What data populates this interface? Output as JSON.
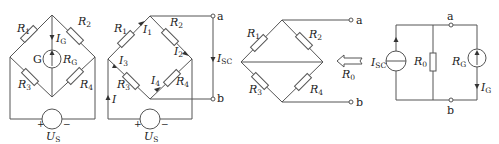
{
  "figure": {
    "panels": [
      {
        "id": "bridge-with-galvanometer",
        "labels": {
          "r1": "R",
          "r1_sub": "1",
          "r2": "R",
          "r2_sub": "2",
          "r3": "R",
          "r3_sub": "3",
          "r4": "R",
          "r4_sub": "4",
          "ig": "I",
          "ig_sub": "G",
          "g": "G",
          "rg": "R",
          "rg_sub": "G",
          "us": "U",
          "us_sub": "S",
          "plus": "+",
          "minus": "−"
        }
      },
      {
        "id": "bridge-short-circuit",
        "labels": {
          "r1": "R",
          "r1_sub": "1",
          "r2": "R",
          "r2_sub": "2",
          "r3": "R",
          "r3_sub": "3",
          "r4": "R",
          "r4_sub": "4",
          "i1": "I",
          "i1_sub": "1",
          "i2": "I",
          "i2_sub": "2",
          "i3": "I",
          "i3_sub": "3",
          "i4": "I",
          "i4_sub": "4",
          "i": "I",
          "isc": "I",
          "isc_sub": "SC",
          "a": "a",
          "b": "b",
          "us": "U",
          "us_sub": "S",
          "plus": "+",
          "minus": "−"
        }
      },
      {
        "id": "bridge-equivalent-resistance",
        "labels": {
          "r1": "R",
          "r1_sub": "1",
          "r2": "R",
          "r2_sub": "2",
          "r3": "R",
          "r3_sub": "3",
          "r4": "R",
          "r4_sub": "4",
          "a": "a",
          "b": "b",
          "r0": "R",
          "r0_sub": "0"
        }
      },
      {
        "id": "norton-equivalent",
        "labels": {
          "isc": "I",
          "isc_sub": "SC",
          "r0": "R",
          "r0_sub": "0",
          "rg": "R",
          "rg_sub": "G",
          "ig": "I",
          "ig_sub": "G",
          "a": "a",
          "b": "b"
        }
      }
    ]
  }
}
